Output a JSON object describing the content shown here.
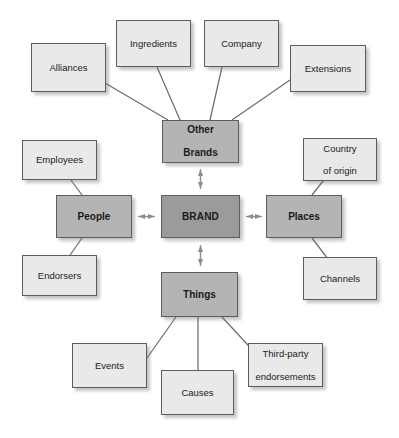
{
  "diagram": {
    "type": "hub-and-spoke concept map",
    "colors": {
      "hub_fill": "#9b9b9b",
      "branch_fill": "#b4b4b4",
      "leaf_fill": "#e9e9e9",
      "border": "#5d5d5d",
      "line": "#6e6e6e",
      "background": "#ffffff",
      "text": "#1a1a1a"
    },
    "hub": {
      "id": "brand",
      "label": "BRAND",
      "level": "hub"
    },
    "branches": [
      {
        "id": "other-brands",
        "label": "Other Brands",
        "label_lines": [
          "Other",
          "Brands"
        ],
        "level": "branch",
        "position": "top",
        "connector": "double-arrow"
      },
      {
        "id": "people",
        "label": "People",
        "label_lines": [
          "People"
        ],
        "level": "branch",
        "position": "left",
        "connector": "double-arrow"
      },
      {
        "id": "places",
        "label": "Places",
        "label_lines": [
          "Places"
        ],
        "level": "branch",
        "position": "right",
        "connector": "double-arrow"
      },
      {
        "id": "things",
        "label": "Things",
        "label_lines": [
          "Things"
        ],
        "level": "branch",
        "position": "bottom",
        "connector": "double-arrow"
      }
    ],
    "leaves": [
      {
        "id": "alliances",
        "label": "Alliances",
        "label_lines": [
          "Alliances"
        ],
        "parent": "other-brands",
        "level": "leaf"
      },
      {
        "id": "ingredients",
        "label": "Ingredients",
        "label_lines": [
          "Ingredients"
        ],
        "parent": "other-brands",
        "level": "leaf"
      },
      {
        "id": "company",
        "label": "Company",
        "label_lines": [
          "Company"
        ],
        "parent": "other-brands",
        "level": "leaf"
      },
      {
        "id": "extensions",
        "label": "Extensions",
        "label_lines": [
          "Extensions"
        ],
        "parent": "other-brands",
        "level": "leaf"
      },
      {
        "id": "employees",
        "label": "Employees",
        "label_lines": [
          "Employees"
        ],
        "parent": "people",
        "level": "leaf"
      },
      {
        "id": "endorsers",
        "label": "Endorsers",
        "label_lines": [
          "Endorsers"
        ],
        "parent": "people",
        "level": "leaf"
      },
      {
        "id": "country-of-origin",
        "label": "Country of origin",
        "label_lines": [
          "Country",
          "of origin"
        ],
        "parent": "places",
        "level": "leaf"
      },
      {
        "id": "channels",
        "label": "Channels",
        "label_lines": [
          "Channels"
        ],
        "parent": "places",
        "level": "leaf"
      },
      {
        "id": "events",
        "label": "Events",
        "label_lines": [
          "Events"
        ],
        "parent": "things",
        "level": "leaf"
      },
      {
        "id": "causes",
        "label": "Causes",
        "label_lines": [
          "Causes"
        ],
        "parent": "things",
        "level": "leaf"
      },
      {
        "id": "third-party-endorsements",
        "label": "Third-party endorsements",
        "label_lines": [
          "Third-party",
          "endorsements"
        ],
        "parent": "things",
        "level": "leaf"
      }
    ]
  }
}
